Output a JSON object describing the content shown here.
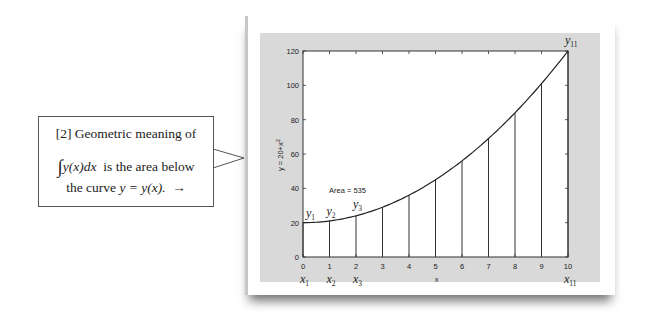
{
  "callout": {
    "line1": "[2] Geometric meaning of",
    "integral_symbol": "∫",
    "integral_upper": "x₁₁",
    "integral_lower": "x₁",
    "integrand": "y(x)dx",
    "line2_rest": "is the area below",
    "line3_pre": "the curve",
    "line3_eq": "y = y(x).",
    "arrow": "→"
  },
  "chart_data": {
    "type": "line",
    "title": "",
    "xlabel": "x",
    "ylabel": "y = 20+x²",
    "function": "y = 20 + x^2",
    "x": [
      0,
      1,
      2,
      3,
      4,
      5,
      6,
      7,
      8,
      9,
      10
    ],
    "values": [
      20,
      21,
      24,
      29,
      36,
      45,
      56,
      69,
      84,
      101,
      120
    ],
    "xlim": [
      0,
      10
    ],
    "ylim": [
      0,
      120
    ],
    "xticks": [
      "0",
      "1",
      "2",
      "3",
      "4",
      "5",
      "6",
      "7",
      "8",
      "9",
      "10"
    ],
    "yticks": [
      "0",
      "20",
      "40",
      "60",
      "80",
      "100",
      "120"
    ],
    "annotation": "Area = 535",
    "vertical_lines_at": [
      0,
      1,
      2,
      3,
      4,
      5,
      6,
      7,
      8,
      9,
      10
    ],
    "point_labels_x": [
      "x1",
      "x2",
      "x3",
      "x11"
    ],
    "point_labels_y": [
      "y1",
      "y2",
      "y3",
      "y11"
    ],
    "grid": false
  },
  "labels": {
    "area": "Area = 535",
    "xlabel": "x",
    "ylabel": "y = 20+x",
    "ylabel_sup": "2"
  }
}
